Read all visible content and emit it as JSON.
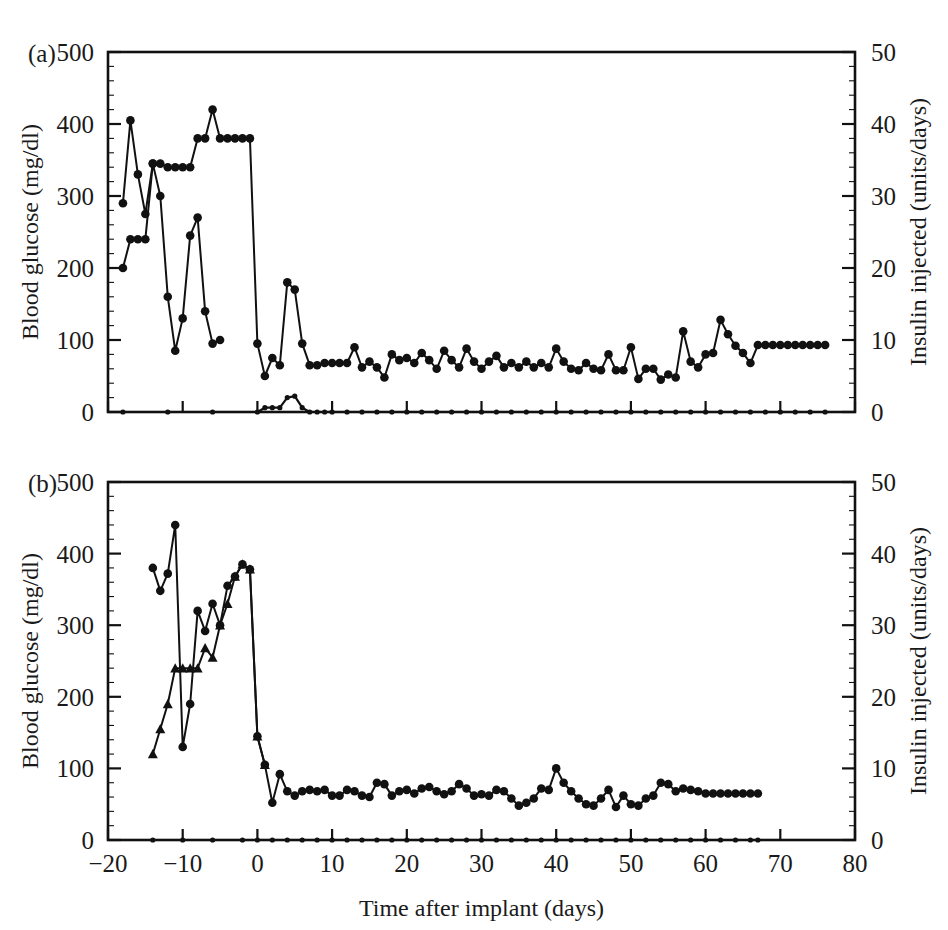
{
  "figure": {
    "panels": [
      {
        "id": "a",
        "label": "(a)",
        "y_left": {
          "title": "Blood glucose (mg/dl)",
          "ticks": [
            "0",
            "100",
            "200",
            "300",
            "400",
            "500"
          ],
          "min": 0,
          "max": 500
        },
        "y_right": {
          "title": "Insulin injected (units/days)",
          "ticks": [
            "0",
            "10",
            "20",
            "30",
            "40",
            "50"
          ],
          "min": 0,
          "max": 50
        },
        "x_axis": {
          "title": "",
          "ticks": [
            "-20",
            "-10",
            "0",
            "10",
            "20",
            "30",
            "40",
            "50",
            "60",
            "70",
            "80"
          ],
          "min": -20,
          "max": 80,
          "show_labels": false
        }
      },
      {
        "id": "b",
        "label": "(b)",
        "y_left": {
          "title": "Blood glucose (mg/dl)",
          "ticks": [
            "0",
            "100",
            "200",
            "300",
            "400",
            "500"
          ],
          "min": 0,
          "max": 500
        },
        "y_right": {
          "title": "Insulin injected (units/days)",
          "ticks": [
            "0",
            "10",
            "20",
            "30",
            "40",
            "50"
          ],
          "min": 0,
          "max": 50
        },
        "x_axis": {
          "title": "Time after implant (days)",
          "ticks": [
            "-20",
            "-10",
            "0",
            "10",
            "20",
            "30",
            "40",
            "50",
            "60",
            "70",
            "80"
          ],
          "min": -20,
          "max": 80,
          "show_labels": true
        }
      }
    ]
  },
  "chart_data": [
    {
      "type": "line",
      "panel": "a",
      "title": "(a)",
      "xlabel": "Time after implant (days)",
      "ylabel": "Blood glucose (mg/dl)",
      "y2label": "Insulin injected (units/days)",
      "xlim": [
        -20,
        80
      ],
      "ylim": [
        0,
        500
      ],
      "y2lim": [
        0,
        50
      ],
      "grid": false,
      "legend": "none",
      "series": [
        {
          "name": "Blood glucose",
          "axis": "left",
          "marker": "filled-circle",
          "x": [
            -18,
            -17,
            -16,
            -15,
            -14,
            -13,
            -12,
            -11,
            -10,
            -9,
            -8,
            -7,
            -6,
            -5,
            -4,
            -3,
            -2,
            -1,
            0,
            1,
            2,
            3,
            4,
            5,
            6,
            7,
            8,
            9,
            10,
            11,
            12,
            13,
            14,
            15,
            16,
            17,
            18,
            19,
            20,
            21,
            22,
            23,
            24,
            25,
            26,
            27,
            28,
            29,
            30,
            31,
            32,
            33,
            34,
            35,
            36,
            37,
            38,
            39,
            40,
            41,
            42,
            43,
            44,
            45,
            46,
            47,
            48,
            49,
            50,
            51,
            52,
            53,
            54,
            55,
            56,
            57,
            58,
            59,
            60,
            61,
            62,
            63,
            64,
            65,
            66,
            67,
            68,
            69,
            70,
            71,
            72,
            73,
            74,
            75,
            76
          ],
          "y": [
            290,
            405,
            330,
            275,
            345,
            345,
            340,
            340,
            340,
            340,
            380,
            380,
            420,
            380,
            380,
            380,
            380,
            380,
            95,
            50,
            75,
            65,
            180,
            170,
            95,
            65,
            65,
            68,
            68,
            68,
            68,
            90,
            62,
            70,
            62,
            48,
            80,
            72,
            75,
            68,
            82,
            72,
            60,
            85,
            72,
            62,
            88,
            70,
            60,
            70,
            78,
            62,
            68,
            62,
            70,
            62,
            68,
            62,
            88,
            70,
            60,
            58,
            68,
            60,
            58,
            80,
            58,
            58,
            90,
            46,
            60,
            60,
            45,
            52,
            48,
            112,
            70,
            62,
            80,
            82,
            128,
            108,
            92,
            82,
            68,
            93,
            93,
            93,
            93,
            93,
            93,
            93,
            93,
            93,
            93
          ]
        },
        {
          "name": "Blood glucose (second animal)",
          "axis": "left",
          "marker": "filled-circle",
          "x": [
            -18,
            -17,
            -16,
            -15,
            -14,
            -13,
            -12,
            -11,
            -10,
            -9,
            -8,
            -7,
            -6,
            -5
          ],
          "y": [
            200,
            240,
            240,
            240,
            345,
            300,
            160,
            85,
            130,
            245,
            270,
            140,
            95,
            100
          ]
        },
        {
          "name": "Insulin injected",
          "axis": "right",
          "marker": "filled-circle",
          "baseline": 0,
          "x": [
            -18,
            -12,
            -6,
            0,
            1,
            2,
            3,
            4,
            5,
            6,
            7,
            8,
            9,
            10,
            12,
            14,
            16,
            18,
            20,
            22,
            24,
            26,
            28,
            30,
            32,
            34,
            36,
            38,
            40,
            42,
            44,
            46,
            48,
            50,
            52,
            54,
            56,
            58,
            60,
            62,
            64,
            66,
            68,
            70,
            72,
            74,
            76
          ],
          "y": [
            0,
            0,
            0,
            0,
            0.6,
            0.6,
            0.6,
            2.0,
            2.2,
            0.6,
            0,
            0,
            0,
            0,
            0,
            0,
            0,
            0,
            0,
            0,
            0,
            0,
            0,
            0,
            0,
            0,
            0,
            0,
            0,
            0,
            0,
            0,
            0,
            0,
            0,
            0,
            0,
            0,
            0,
            0,
            0,
            0,
            0,
            0,
            0,
            0,
            0
          ]
        }
      ]
    },
    {
      "type": "line",
      "panel": "b",
      "title": "(b)",
      "xlabel": "Time after implant (days)",
      "ylabel": "Blood glucose (mg/dl)",
      "y2label": "Insulin injected (units/days)",
      "xlim": [
        -20,
        80
      ],
      "ylim": [
        0,
        500
      ],
      "y2lim": [
        0,
        50
      ],
      "grid": false,
      "legend": "none",
      "series": [
        {
          "name": "Blood glucose",
          "axis": "left",
          "marker": "filled-circle",
          "x": [
            -14,
            -13,
            -12,
            -11,
            -10,
            -9,
            -8,
            -7,
            -6,
            -5,
            -4,
            -3,
            -2,
            -1,
            0,
            1,
            2,
            3,
            4,
            5,
            6,
            7,
            8,
            9,
            10,
            11,
            12,
            13,
            14,
            15,
            16,
            17,
            18,
            19,
            20,
            21,
            22,
            23,
            24,
            25,
            26,
            27,
            28,
            29,
            30,
            31,
            32,
            33,
            34,
            35,
            36,
            37,
            38,
            39,
            40,
            41,
            42,
            43,
            44,
            45,
            46,
            47,
            48,
            49,
            50,
            51,
            52,
            53,
            54,
            55,
            56,
            57,
            58,
            59,
            60,
            61,
            62,
            63,
            64,
            65,
            66,
            67
          ],
          "y": [
            380,
            348,
            372,
            440,
            130,
            190,
            320,
            292,
            330,
            300,
            355,
            368,
            385,
            378,
            145,
            105,
            52,
            92,
            68,
            62,
            68,
            70,
            68,
            70,
            62,
            62,
            70,
            68,
            62,
            60,
            80,
            78,
            62,
            68,
            70,
            65,
            72,
            74,
            68,
            64,
            68,
            78,
            72,
            62,
            64,
            62,
            70,
            68,
            58,
            48,
            52,
            58,
            72,
            70,
            100,
            80,
            68,
            58,
            50,
            48,
            58,
            70,
            46,
            62,
            50,
            48,
            58,
            62,
            80,
            78,
            68,
            72,
            70,
            68,
            65,
            65,
            65,
            65,
            65,
            65,
            65,
            65
          ]
        },
        {
          "name": "Blood glucose (second animal)",
          "axis": "left",
          "marker": "filled-triangle",
          "x": [
            -14,
            -13,
            -12,
            -11,
            -10,
            -9,
            -8,
            -7,
            -6,
            -5,
            -4,
            -3,
            -2,
            -1,
            0,
            1
          ],
          "y": [
            120,
            155,
            190,
            240,
            240,
            240,
            240,
            268,
            255,
            300,
            330,
            368,
            385,
            378,
            145,
            105
          ]
        },
        {
          "name": "Insulin injected",
          "axis": "right",
          "marker": "filled-circle",
          "baseline": 0,
          "x": [
            -14,
            -10,
            -6,
            -2,
            0,
            2,
            4,
            6,
            8,
            10,
            12,
            14,
            16,
            18,
            20,
            22,
            24,
            26,
            28,
            30,
            32,
            34,
            36,
            38,
            40,
            42,
            44,
            46,
            48,
            50,
            52,
            54,
            56,
            58,
            60,
            62,
            64,
            66,
            67
          ],
          "y": [
            0,
            0,
            0,
            0,
            0,
            0,
            0,
            0,
            0,
            0,
            0,
            0,
            0,
            0,
            0,
            0,
            0,
            0,
            0,
            0,
            0,
            0,
            0,
            0,
            0,
            0,
            0,
            0,
            0,
            0,
            0,
            0,
            0,
            0,
            0,
            0,
            0,
            0,
            0
          ]
        }
      ]
    }
  ]
}
